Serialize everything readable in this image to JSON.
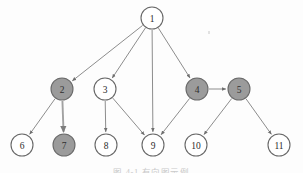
{
  "figure": {
    "title": "",
    "caption": "图 4-1  有向图示例",
    "background_color": "#fdfdfd",
    "node_fill_highlight": "#9b9b9b",
    "node_fill_plain": "#ffffff",
    "node_stroke": "#676767",
    "edge_color": "#8d8d8d"
  },
  "chart_data": {
    "type": "diagram",
    "diagram_kind": "directed-graph",
    "title": "",
    "nodes": [
      {
        "id": "1",
        "label": "1",
        "x": 152,
        "y": 18,
        "r": 11,
        "fill": "hollow"
      },
      {
        "id": "2",
        "label": "2",
        "x": 62,
        "y": 89,
        "r": 11,
        "fill": "filled"
      },
      {
        "id": "3",
        "label": "3",
        "x": 105,
        "y": 89,
        "r": 11,
        "fill": "hollow"
      },
      {
        "id": "4",
        "label": "4",
        "x": 197,
        "y": 89,
        "r": 11,
        "fill": "filled"
      },
      {
        "id": "5",
        "label": "5",
        "x": 239,
        "y": 89,
        "r": 11,
        "fill": "filled"
      },
      {
        "id": "6",
        "label": "6",
        "x": 22,
        "y": 145,
        "r": 11,
        "fill": "hollow"
      },
      {
        "id": "7",
        "label": "7",
        "x": 64,
        "y": 145,
        "r": 11,
        "fill": "filled"
      },
      {
        "id": "8",
        "label": "8",
        "x": 106,
        "y": 145,
        "r": 11,
        "fill": "hollow"
      },
      {
        "id": "9",
        "label": "9",
        "x": 153,
        "y": 145,
        "r": 11,
        "fill": "hollow"
      },
      {
        "id": "10",
        "label": "10",
        "x": 196,
        "y": 145,
        "r": 11,
        "fill": "hollow"
      },
      {
        "id": "11",
        "label": "11",
        "x": 279,
        "y": 145,
        "r": 11,
        "fill": "hollow"
      }
    ],
    "edges": [
      {
        "from": "1",
        "to": "2",
        "directed": true,
        "weight": "thin"
      },
      {
        "from": "1",
        "to": "3",
        "directed": true,
        "weight": "thin"
      },
      {
        "from": "1",
        "to": "9",
        "directed": true,
        "weight": "thin"
      },
      {
        "from": "1",
        "to": "4",
        "directed": true,
        "weight": "thin"
      },
      {
        "from": "2",
        "to": "6",
        "directed": true,
        "weight": "thin"
      },
      {
        "from": "2",
        "to": "7",
        "directed": true,
        "weight": "thick"
      },
      {
        "from": "3",
        "to": "8",
        "directed": true,
        "weight": "thin"
      },
      {
        "from": "3",
        "to": "9",
        "directed": true,
        "weight": "thin"
      },
      {
        "from": "4",
        "to": "5",
        "directed": true,
        "weight": "thin"
      },
      {
        "from": "4",
        "to": "9",
        "directed": true,
        "weight": "thin"
      },
      {
        "from": "5",
        "to": "10",
        "directed": true,
        "weight": "thin"
      },
      {
        "from": "5",
        "to": "11",
        "directed": true,
        "weight": "thin"
      }
    ],
    "highlighted_nodes": [
      "2",
      "4",
      "5",
      "7"
    ],
    "node_count": 11,
    "edge_count": 12
  }
}
